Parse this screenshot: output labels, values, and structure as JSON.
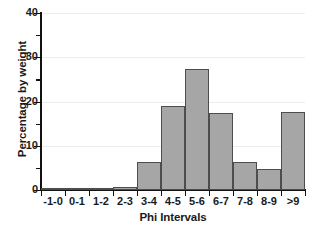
{
  "chart_data": {
    "type": "bar",
    "title": "",
    "xlabel": "Phi Intervals",
    "ylabel": "Percentage by weight",
    "categories": [
      "-1-0",
      "0-1",
      "1-2",
      "2-3",
      "3-4",
      "4-5",
      "5-6",
      "6-7",
      "7-8",
      "8-9",
      ">9"
    ],
    "values": [
      0.2,
      0.4,
      0.3,
      0.6,
      6.3,
      19.0,
      27.3,
      17.4,
      6.3,
      4.8,
      17.6
    ],
    "ylim": [
      0,
      40
    ],
    "y_ticks_major": [
      0,
      10,
      20,
      30,
      40
    ],
    "y_tick_labels": [
      "0",
      "10",
      "20",
      "30",
      "40"
    ],
    "y_ticks_minor": [
      5,
      15,
      25,
      35
    ],
    "grid": "horizontal-major-only",
    "legend": "none",
    "bar_color": "#a6a6a6",
    "bar_edge_color": "#4d4d4d",
    "axis_color": "#111111",
    "gridline_color": "#ededed",
    "background_color": "#ffffff"
  }
}
